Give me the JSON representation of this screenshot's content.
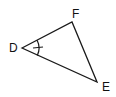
{
  "diagram": {
    "type": "triangle",
    "name": "Triangle DEF",
    "stroke_color": "#1a1a1a",
    "background": "#ffffff",
    "vertices": [
      {
        "id": "D",
        "label": "D",
        "x": 22,
        "y": 48,
        "label_x": 9,
        "label_y": 52
      },
      {
        "id": "F",
        "label": "F",
        "x": 72,
        "y": 22,
        "label_x": 72,
        "label_y": 18
      },
      {
        "id": "E",
        "label": "E",
        "x": 97,
        "y": 82,
        "label_x": 102,
        "label_y": 91
      }
    ],
    "sides": [
      {
        "from": "D",
        "to": "F"
      },
      {
        "from": "F",
        "to": "E"
      },
      {
        "from": "E",
        "to": "D"
      }
    ],
    "angle_marks": [
      {
        "vertex": "D",
        "arcs": 1,
        "ticks": 1,
        "radius": 17
      }
    ]
  }
}
